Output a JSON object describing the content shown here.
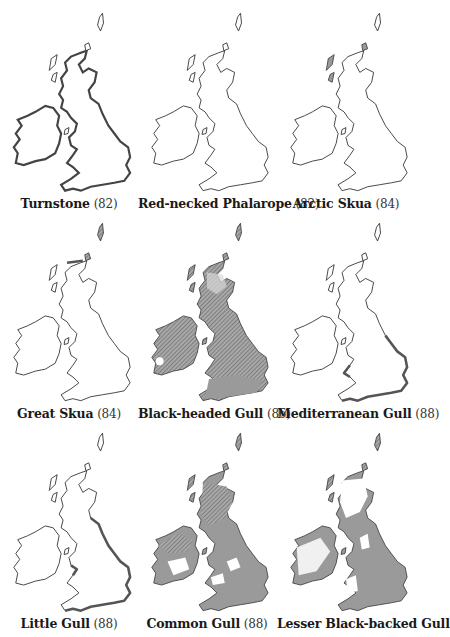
{
  "figure": {
    "maps": [
      {
        "name": "Turnstone",
        "year": "(82)",
        "style": "bold-coast"
      },
      {
        "name": "Red-necked Phalarope",
        "year": "(82)",
        "style": "outline"
      },
      {
        "name": "Arctic Skua",
        "year": "(84)",
        "style": "outline-north"
      },
      {
        "name": "Great Skua",
        "year": "(84)",
        "style": "outline-north"
      },
      {
        "name": "Black-headed Gull",
        "year": "(86)",
        "style": "full-hatched"
      },
      {
        "name": "Mediterranean Gull",
        "year": "(88)",
        "style": "south-east-coast"
      },
      {
        "name": "Little Gull",
        "year": "(88)",
        "style": "east-coast"
      },
      {
        "name": "Common Gull",
        "year": "(88)",
        "style": "full-grey-patchy"
      },
      {
        "name": "Lesser Black-backed Gull",
        "year": "",
        "style": "full-grey-patchy"
      }
    ]
  },
  "colors": {
    "background": "#ffffff",
    "outline": "#333333",
    "shade": "#9a9a9a",
    "hatch": "#555555"
  }
}
